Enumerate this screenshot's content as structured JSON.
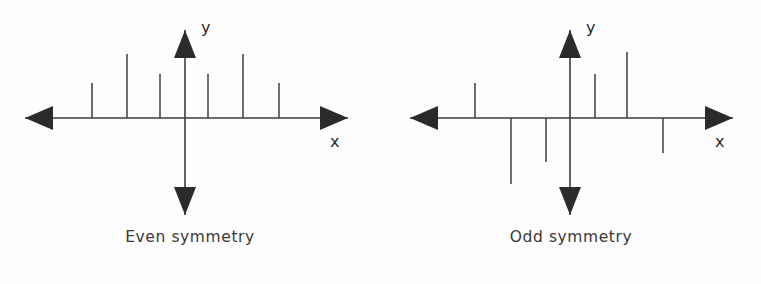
{
  "figure": {
    "background_color": "#fdfdfd",
    "stroke_color": "#3d3d3d",
    "panels": [
      {
        "id": "even",
        "caption": "Even symmetry",
        "x_axis_label": "x",
        "y_axis_label": "y"
      },
      {
        "id": "odd",
        "caption": "Odd symmetry",
        "x_axis_label": "x",
        "y_axis_label": "y"
      }
    ]
  },
  "chart_data": [
    {
      "type": "bar",
      "id": "even-symmetry-stem-plot",
      "title": "Even symmetry",
      "xlabel": "x",
      "ylabel": "y",
      "subtype": "stem",
      "grid": false,
      "legend": false,
      "axis_origin_px": {
        "x": 185,
        "y": 118
      },
      "x_axis_range_px": [
        25,
        348
      ],
      "y_axis_range_px": [
        30,
        215
      ],
      "categories": [
        -3,
        -2,
        -1,
        1,
        2,
        3
      ],
      "values": [
        35,
        64,
        44,
        44,
        64,
        35
      ],
      "stems_px": [
        {
          "x": 92,
          "top": 83
        },
        {
          "x": 127,
          "top": 54
        },
        {
          "x": 160,
          "top": 74
        },
        {
          "x": 208,
          "top": 74
        },
        {
          "x": 243,
          "top": 54
        },
        {
          "x": 279,
          "top": 83
        }
      ],
      "annotation": "x[-n] = x[n]"
    },
    {
      "type": "bar",
      "id": "odd-symmetry-stem-plot",
      "title": "Odd symmetry",
      "xlabel": "x",
      "ylabel": "y",
      "subtype": "stem",
      "grid": false,
      "legend": false,
      "axis_origin_px": {
        "x": 570,
        "y": 118
      },
      "x_axis_range_px": [
        410,
        733
      ],
      "y_axis_range_px": [
        30,
        215
      ],
      "categories": [
        -3,
        -2,
        -1,
        1,
        2,
        3
      ],
      "values": [
        35,
        -66,
        -44,
        44,
        66,
        -35
      ],
      "stems_px": [
        {
          "x": 475,
          "top": 83
        },
        {
          "x": 511,
          "top": 184
        },
        {
          "x": 546,
          "top": 162
        },
        {
          "x": 595,
          "top": 74
        },
        {
          "x": 627,
          "top": 52
        },
        {
          "x": 663,
          "top": 153
        }
      ],
      "annotation": "x[-n] = -x[n]"
    }
  ]
}
